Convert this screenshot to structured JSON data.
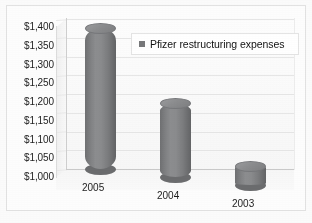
{
  "chart_data": {
    "type": "bar",
    "title": "",
    "subtitle": "",
    "xlabel": "",
    "ylabel": "",
    "categories": [
      "2005",
      "2004",
      "2003"
    ],
    "values": [
      1375,
      1195,
      1050
    ],
    "series": [
      {
        "name": "Pfizer restructuring expenses",
        "values": [
          1375,
          1195,
          1050
        ],
        "color": "#7e7f81"
      }
    ],
    "ylim": [
      1000,
      1400
    ],
    "ytick_step": 50,
    "ytick_labels": [
      "$1,400",
      "$1,350",
      "$1,300",
      "$1,250",
      "$1,200",
      "$1,150",
      "$1,100",
      "$1,050",
      "$1,000"
    ],
    "ytick_values": [
      1400,
      1350,
      1300,
      1250,
      1200,
      1150,
      1100,
      1050,
      1000
    ],
    "grid": true,
    "grid_axis": "y",
    "legend": {
      "position": "top-right-inside",
      "entries": [
        {
          "label": "Pfizer restructuring expenses",
          "color": "#77787a"
        }
      ]
    },
    "style": {
      "render": "3d-cylinder",
      "bar_color": "#7e7f81",
      "bar_highlight": "#8c8d8f",
      "bar_shadow": "#6a6b6d",
      "plot_background": "#fbfbfb",
      "gridline_color": "#e6e6e6",
      "axis_color": "#cfcfcf",
      "text_color": "#1d1d1d"
    }
  },
  "legend": {
    "entry_label": "Pfizer restructuring expenses"
  },
  "yaxis": {
    "labels": [
      "$1,400",
      "$1,350",
      "$1,300",
      "$1,250",
      "$1,200",
      "$1,150",
      "$1,100",
      "$1,050",
      "$1,000"
    ]
  },
  "xaxis": {
    "labels": [
      "2005",
      "2004",
      "2003"
    ]
  }
}
